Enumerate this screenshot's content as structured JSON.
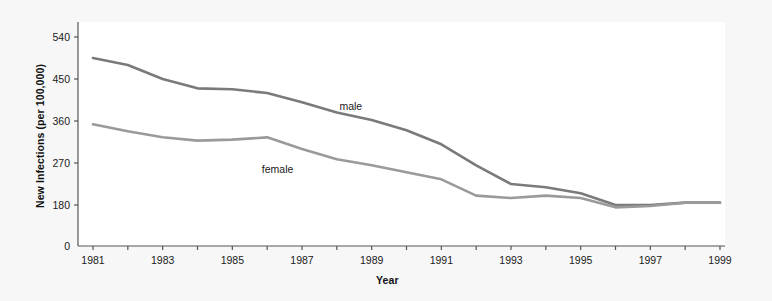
{
  "chart_data": {
    "type": "line",
    "title": "",
    "xlabel": "Year",
    "ylabel": "New Infections (per 100,000)",
    "x": [
      1981,
      1982,
      1983,
      1984,
      1985,
      1986,
      1987,
      1988,
      1989,
      1990,
      1991,
      1992,
      1993,
      1994,
      1995,
      1996,
      1997,
      1998,
      1999
    ],
    "xlim": [
      1981,
      1999
    ],
    "ylim": [
      0,
      540
    ],
    "grid": false,
    "legend_position": "inline-annotation",
    "xtick_values": [
      1981,
      1982,
      1983,
      1984,
      1985,
      1986,
      1987,
      1988,
      1989,
      1990,
      1991,
      1992,
      1993,
      1994,
      1995,
      1996,
      1997,
      1998,
      1999
    ],
    "xtick_labels": [
      "1981",
      "",
      "1983",
      "",
      "1985",
      "",
      "1987",
      "",
      "1989",
      "",
      "1991",
      "",
      "1993",
      "",
      "1995",
      "",
      "1997",
      "",
      "1999"
    ],
    "ytick_values": [
      0,
      180,
      270,
      360,
      450,
      540
    ],
    "ytick_labels": [
      "0",
      "180",
      "270",
      "360",
      "450",
      "540"
    ],
    "y_axis_break_note": "axis compressed between 0 and 180",
    "series": [
      {
        "name": "male",
        "color": "#7a7a7a",
        "label_x": 1988.4,
        "label_y": 392,
        "values": [
          495,
          480,
          450,
          430,
          428,
          420,
          400,
          378,
          362,
          340,
          310,
          265,
          225,
          218,
          205,
          180,
          180,
          185,
          185
        ]
      },
      {
        "name": "female",
        "color": "#9a9a9a",
        "label_x": 1986.3,
        "label_y": 258,
        "values": [
          353,
          338,
          325,
          318,
          320,
          325,
          300,
          278,
          265,
          250,
          235,
          200,
          195,
          200,
          195,
          175,
          178,
          185,
          185
        ]
      }
    ]
  },
  "figure": {
    "background": "#f7f7f7",
    "plot_background": "#ffffff",
    "axis_color": "#555555"
  }
}
